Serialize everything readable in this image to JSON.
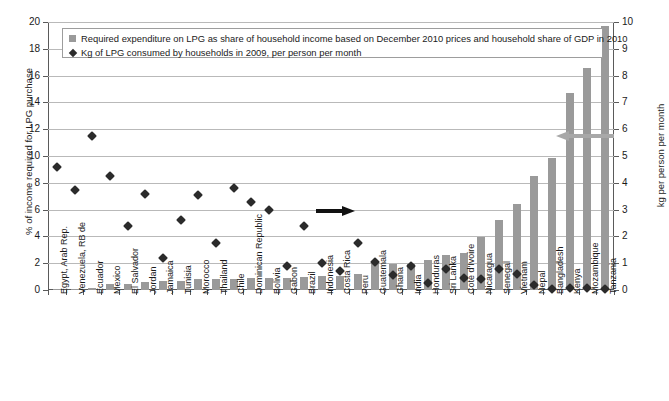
{
  "chart_data": {
    "type": "bar",
    "title": "",
    "xlabel": "",
    "ylabel": "% of income required for LPG purchase",
    "ylabel_right": "kg per person per month",
    "ylim": [
      0,
      20
    ],
    "ylim_right": [
      0,
      10
    ],
    "yticks": [
      0,
      2,
      4,
      6,
      8,
      10,
      12,
      14,
      16,
      18,
      20
    ],
    "yticks_right": [
      0,
      1,
      2,
      3,
      4,
      5,
      6,
      7,
      8,
      9,
      10
    ],
    "grid": true,
    "legend_position": "top-inside",
    "categories": [
      "Egypt, Arab Rep.",
      "Venezuela, RB de",
      "Ecuador",
      "Mexico",
      "El Salvador",
      "Jordan",
      "Jamaica",
      "Tunisia",
      "Morocco",
      "Thailand",
      "Chile",
      "Dominican Republic",
      "Bolivia",
      "Gabon",
      "Brazil",
      "Indonesia",
      "Costa Rica",
      "Peru",
      "Guatemala",
      "Ghana",
      "India",
      "Honduras",
      "Sri Lanka",
      "Cote d'Ivoire",
      "Nicaragua",
      "Senegal",
      "Vietnam",
      "Nepal",
      "Bangladesh",
      "Kenya",
      "Mozambique",
      "Tanzania"
    ],
    "series": [
      {
        "name": "Required expenditure on LPG as share of household income based on December 2010 prices and household share of GDP in 2010",
        "type": "bar",
        "axis": "left",
        "unit": "% of income",
        "color": "#9a9a9a",
        "values": [
          0.1,
          0.1,
          0.15,
          0.45,
          0.45,
          0.6,
          0.7,
          0.7,
          0.85,
          0.85,
          0.85,
          0.9,
          0.9,
          0.9,
          0.95,
          1.05,
          1.05,
          1.2,
          2.1,
          1.95,
          1.95,
          2.25,
          2.6,
          2.75,
          3.95,
          5.25,
          6.4,
          8.5,
          9.85,
          14.7,
          16.55,
          19.7
        ]
      },
      {
        "name": "Kg of LPG consumed by households in 2009, per person per month",
        "type": "scatter",
        "axis": "right",
        "unit": "kg per person per month",
        "color": "#2b2b2b",
        "marker": "diamond",
        "values": [
          4.6,
          3.75,
          5.75,
          4.25,
          2.4,
          3.6,
          1.2,
          2.6,
          3.55,
          1.75,
          3.8,
          3.3,
          3.0,
          0.9,
          2.4,
          1.0,
          0.7,
          1.75,
          1.05,
          0.55,
          0.9,
          0.25,
          0.8,
          0.45,
          0.4,
          0.8,
          0.6,
          0.2,
          0.05,
          0.08,
          0.08,
          0.03
        ]
      }
    ],
    "annotations": [
      {
        "name": "arrow-to-right-axis",
        "direction": "right",
        "color": "#111111",
        "meaning": "diamond series reads on right axis"
      },
      {
        "name": "arrow-to-left-axis",
        "direction": "left",
        "color": "#a8a8a8",
        "meaning": "bar series reads on left axis"
      }
    ]
  },
  "legend": {
    "items": [
      {
        "marker": "square",
        "label": "Required expenditure on LPG as share of household income based on December 2010 prices and household share of GDP in 2010"
      },
      {
        "marker": "diamond",
        "label": "Kg of LPG consumed by households in 2009, per person per month"
      }
    ]
  }
}
